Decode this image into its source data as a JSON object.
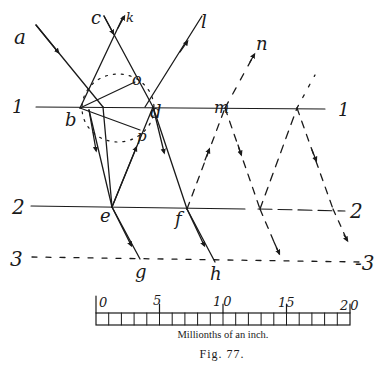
{
  "figure": {
    "caption": "Fig. 77.",
    "point_labels": {
      "a": "a",
      "b": "b",
      "c": "c",
      "d": "d",
      "e": "e",
      "f": "f",
      "g": "g",
      "h": "h",
      "l": "l",
      "m": "m",
      "n": "n",
      "o": "o",
      "p": "p",
      "k": "k"
    },
    "surface_labels": {
      "line1_left": "1",
      "line1_right": "1",
      "line2_left": "2",
      "line2_right": "2",
      "line3_left": "3",
      "line3_right": "-3"
    },
    "scale": {
      "ticks": [
        "0",
        "5",
        "10",
        "15",
        "20"
      ],
      "divisions": 20,
      "unit_label": "Millionths of an inch."
    }
  }
}
